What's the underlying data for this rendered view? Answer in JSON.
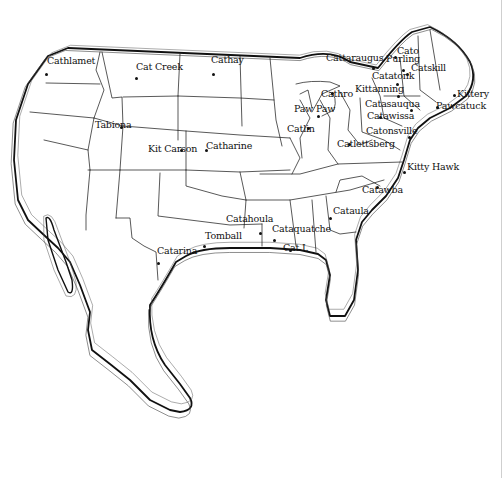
{
  "map": {
    "subject": "Outline map of the United States with state borders",
    "colors": {
      "background": "#ffffff",
      "ink": "#111111"
    },
    "places": [
      {
        "name": "Cathlamet",
        "label_x": 47,
        "label_y": 64,
        "dot_x": 46,
        "dot_y": 74
      },
      {
        "name": "Cat Creek",
        "label_x": 136,
        "label_y": 70,
        "dot_x": 136,
        "dot_y": 78
      },
      {
        "name": "Cathay",
        "label_x": 211,
        "label_y": 63,
        "dot_x": 213,
        "dot_y": 74
      },
      {
        "name": "Cattaraugus",
        "label_x": 326,
        "label_y": 61,
        "dot_x": 373,
        "dot_y": 68
      },
      {
        "name": "Cato",
        "label_x": 397,
        "label_y": 54,
        "dot_x": 395,
        "dot_y": 57
      },
      {
        "name": "Purling",
        "label_x": 386,
        "label_y": 62,
        "dot_x": 403,
        "dot_y": 70
      },
      {
        "name": "Catskill",
        "label_x": 411,
        "label_y": 71,
        "dot_x": 407,
        "dot_y": 74
      },
      {
        "name": "Catatonk",
        "label_x": 372,
        "label_y": 79,
        "dot_x": 397,
        "dot_y": 84
      },
      {
        "name": "Kittanning",
        "label_x": 355,
        "label_y": 92,
        "dot_x": 398,
        "dot_y": 96
      },
      {
        "name": "Cathro",
        "label_x": 321,
        "label_y": 97,
        "dot_x": 332,
        "dot_y": 93
      },
      {
        "name": "Paw Paw",
        "label_x": 294,
        "label_y": 112,
        "dot_x": 318,
        "dot_y": 116
      },
      {
        "name": "Catasauqua",
        "label_x": 365,
        "label_y": 107,
        "dot_x": 411,
        "dot_y": 110
      },
      {
        "name": "Catawissa",
        "label_x": 367,
        "label_y": 119,
        "dot_x": 380,
        "dot_y": 117
      },
      {
        "name": "Kittery",
        "label_x": 457,
        "label_y": 97,
        "dot_x": 454,
        "dot_y": 95
      },
      {
        "name": "Pawcatuck",
        "label_x": 436,
        "label_y": 109,
        "dot_x": 437,
        "dot_y": 107
      },
      {
        "name": "Catlin",
        "label_x": 287,
        "label_y": 132,
        "dot_x": 308,
        "dot_y": 128
      },
      {
        "name": "Catonsville",
        "label_x": 366,
        "label_y": 134,
        "dot_x": 409,
        "dot_y": 137
      },
      {
        "name": "Catlettsberg",
        "label_x": 337,
        "label_y": 147,
        "dot_x": 349,
        "dot_y": 144
      },
      {
        "name": "Kitty Hawk",
        "label_x": 407,
        "label_y": 170,
        "dot_x": 404,
        "dot_y": 172
      },
      {
        "name": "Catawba",
        "label_x": 362,
        "label_y": 193,
        "dot_x": 377,
        "dot_y": 187
      },
      {
        "name": "Cataula",
        "label_x": 333,
        "label_y": 214,
        "dot_x": 330,
        "dot_y": 218
      },
      {
        "name": "Tabiona",
        "label_x": 95,
        "label_y": 128,
        "dot_x": 121,
        "dot_y": 127
      },
      {
        "name": "Kit Carson",
        "label_x": 148,
        "label_y": 152,
        "dot_x": 181,
        "dot_y": 150
      },
      {
        "name": "Catharine",
        "label_x": 206,
        "label_y": 149,
        "dot_x": 206,
        "dot_y": 150
      },
      {
        "name": "Catahoula",
        "label_x": 226,
        "label_y": 222,
        "dot_x": 260,
        "dot_y": 233
      },
      {
        "name": "Cataquatche",
        "label_x": 272,
        "label_y": 232,
        "dot_x": 274,
        "dot_y": 240
      },
      {
        "name": "Tomball",
        "label_x": 205,
        "label_y": 239,
        "dot_x": 204,
        "dot_y": 246
      },
      {
        "name": "Catarina",
        "label_x": 157,
        "label_y": 254,
        "dot_x": 158,
        "dot_y": 263
      },
      {
        "name": "Cat I.",
        "label_x": 283,
        "label_y": 251,
        "dot_x": 290,
        "dot_y": 250
      }
    ]
  }
}
